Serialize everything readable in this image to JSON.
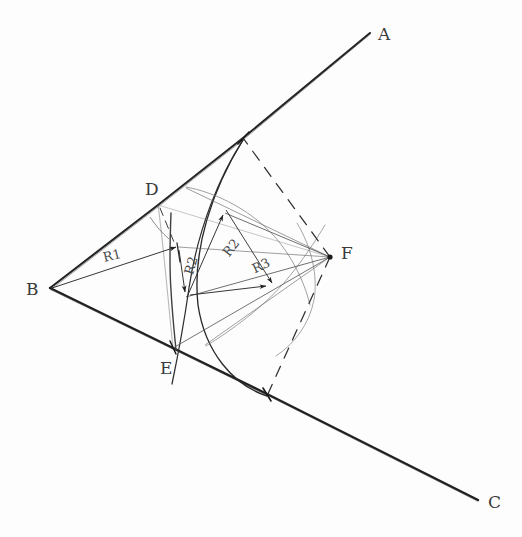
{
  "canvas": {
    "width": 522,
    "height": 537,
    "background_color": "#fdfdfd",
    "ink_color": "#2b2b2b",
    "light_ink_color": "#6a6a6a"
  },
  "figure": {
    "kind": "hand-drawn geometric construction sketch"
  },
  "vertex_labels": [
    {
      "id": "A",
      "text": "A",
      "x": 378,
      "y": 24,
      "role": "ray-endpoint-upper"
    },
    {
      "id": "B",
      "text": "B",
      "x": 26,
      "y": 279,
      "role": "angle-vertex"
    },
    {
      "id": "C",
      "text": "C",
      "x": 488,
      "y": 492,
      "role": "ray-endpoint-lower"
    },
    {
      "id": "D",
      "text": "D",
      "x": 145,
      "y": 179,
      "role": "point-on-ray-BA"
    },
    {
      "id": "E",
      "text": "E",
      "x": 160,
      "y": 358,
      "role": "point-on-ray-BC"
    },
    {
      "id": "F",
      "text": "F",
      "x": 341,
      "y": 243,
      "role": "radii-convergence-point"
    }
  ],
  "radius_labels": [
    {
      "id": "R1",
      "text": "R1",
      "x": 103,
      "y": 248,
      "rotation": -14,
      "role": "radius-label-one"
    },
    {
      "id": "R2v",
      "text": "R2",
      "x": 182,
      "y": 258,
      "rotation": -74,
      "role": "radius-label-two-vertical"
    },
    {
      "id": "R2",
      "text": "R2",
      "x": 222,
      "y": 240,
      "rotation": -52,
      "role": "radius-label-two"
    },
    {
      "id": "R3",
      "text": "R3",
      "x": 252,
      "y": 258,
      "rotation": -25,
      "role": "radius-label-three"
    }
  ],
  "geometry": {
    "points": {
      "B": [
        50,
        288
      ],
      "A_end": [
        370,
        33
      ],
      "C_end": [
        478,
        500
      ],
      "D": [
        158,
        205
      ],
      "E": [
        173,
        348
      ],
      "F": [
        330,
        257
      ],
      "T_upper": [
        243,
        138
      ],
      "T_lower": [
        267,
        394
      ],
      "P1": [
        178,
        247
      ],
      "P2": [
        186,
        297
      ],
      "P3": [
        225,
        213
      ],
      "P4": [
        268,
        287
      ]
    },
    "rays": [
      {
        "name": "ray-BA",
        "from": "B",
        "to": "A_end"
      },
      {
        "name": "ray-BC",
        "from": "B",
        "to": "C_end"
      }
    ],
    "chord": {
      "name": "chord-DE",
      "from": "D",
      "to": "E"
    },
    "dashed_lines": [
      {
        "name": "dashed-F-to-upper-tangent",
        "from": "F",
        "to": "T_upper"
      },
      {
        "name": "dashed-F-to-lower-tangent",
        "from": "F",
        "to": "T_lower"
      },
      {
        "name": "dashed-D-short",
        "from": "D",
        "to": [
          172,
          238
        ]
      }
    ],
    "arrows": [
      {
        "name": "arrow-R1",
        "from": "B",
        "to": "P1"
      },
      {
        "name": "arrow-R2-vertical",
        "from": "P1",
        "to": "P2"
      },
      {
        "name": "arrow-R2",
        "from": "P2",
        "to": "P3"
      },
      {
        "name": "arrow-R3",
        "from": "P3",
        "to": "P4"
      }
    ],
    "arcs": [
      {
        "name": "arc-major-through-DE",
        "description": "arc from upper tangent point through region near D and E down to lower tangent point"
      },
      {
        "name": "arc-inner",
        "description": "smaller arc crossing the chord region"
      }
    ]
  }
}
